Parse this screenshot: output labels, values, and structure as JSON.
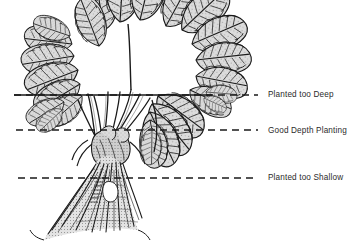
{
  "figure": {
    "name": "strawberry-planting-depth-diagram",
    "background_color": "#ffffff",
    "ink_color": "#1a1a1a",
    "leaf_fill_color": "#d9d9d9",
    "text_color": "#2b2b2b"
  },
  "depth_lines": [
    {
      "id": "too-deep",
      "label": "Planted too Deep",
      "y": 95,
      "x_start": 14,
      "x_end": 258,
      "style": "solid-through-foliage-then-dashed"
    },
    {
      "id": "good-depth",
      "label": "Good Depth Planting",
      "y": 130,
      "x_start": 16,
      "x_end": 258,
      "style": "dashed"
    },
    {
      "id": "too-shallow",
      "label": "Planted too Shallow",
      "y": 178,
      "x_start": 18,
      "x_end": 258,
      "style": "dashed"
    }
  ],
  "labels": {
    "too_deep": "Planted too Deep",
    "good_depth": "Good Depth Planting",
    "too_shallow": "Planted too Shallow"
  }
}
